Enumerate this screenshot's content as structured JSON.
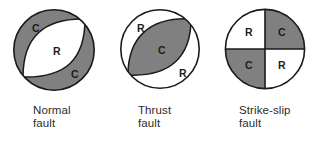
{
  "figure": {
    "background_color": "#ffffff",
    "compression_color": "#808080",
    "dilatation_color": "#ffffff",
    "outline_color": "#1a1a1a",
    "label_color": "#1c1c1c"
  },
  "diagrams": [
    {
      "id": "normal-fault",
      "caption_line1": "Normal",
      "caption_line2": "fault",
      "quadrant_labels": [
        {
          "text": "C",
          "meaning": "compression",
          "position": "upper-left"
        },
        {
          "text": "R",
          "meaning": "rarefaction",
          "position": "center"
        },
        {
          "text": "C",
          "meaning": "compression",
          "position": "lower-right"
        }
      ]
    },
    {
      "id": "thrust-fault",
      "caption_line1": "Thrust",
      "caption_line2": "fault",
      "quadrant_labels": [
        {
          "text": "R",
          "meaning": "rarefaction",
          "position": "upper-left"
        },
        {
          "text": "C",
          "meaning": "compression",
          "position": "center"
        },
        {
          "text": "R",
          "meaning": "rarefaction",
          "position": "lower-right"
        }
      ]
    },
    {
      "id": "strike-slip-fault",
      "caption_line1": "Strike-slip",
      "caption_line2": "fault",
      "quadrant_labels": [
        {
          "text": "R",
          "meaning": "rarefaction",
          "position": "upper-left"
        },
        {
          "text": "C",
          "meaning": "compression",
          "position": "upper-right"
        },
        {
          "text": "C",
          "meaning": "compression",
          "position": "lower-left"
        },
        {
          "text": "R",
          "meaning": "rarefaction",
          "position": "lower-right"
        }
      ]
    }
  ]
}
